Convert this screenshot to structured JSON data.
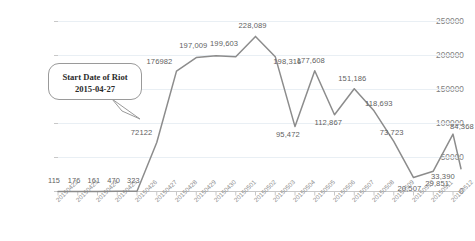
{
  "chart_data": {
    "type": "line",
    "title": "",
    "subtitle": "",
    "xlabel": "",
    "ylabel": "",
    "grid": true,
    "legend_position": "none",
    "ylim": [
      0,
      250000
    ],
    "yticks": [
      0,
      50000,
      100000,
      150000,
      200000,
      250000
    ],
    "ytick_labels": [
      "0",
      "50000",
      "100000",
      "150000",
      "200000",
      "250000"
    ],
    "categories": [
      "20150422",
      "20150423",
      "20150424",
      "20150425",
      "20150426",
      "20150427",
      "20150428",
      "20150429",
      "20150430",
      "20150501",
      "20150502",
      "20150503",
      "20150504",
      "20150505",
      "20150506",
      "20150507",
      "20150508",
      "20150509",
      "20150510",
      "20150511",
      "20150512"
    ],
    "values": [
      115,
      176,
      161,
      470,
      323,
      72122,
      176982,
      197009,
      199603,
      198316,
      228089,
      198316,
      95472,
      177608,
      112867,
      151186,
      118693,
      73723,
      20507,
      29851,
      84368
    ],
    "point_labels": [
      "115",
      "176",
      "161",
      "470",
      "323",
      "72122",
      "176982",
      "197,009",
      "199,603",
      "",
      "228,089",
      "198,316",
      "95,472",
      "177,608",
      "112,867",
      "151,186",
      "118,693",
      "73,723",
      "20,507",
      "29,851",
      "84,368"
    ],
    "extra_labels": [
      "33,390"
    ],
    "line_color": "#8c8c8c",
    "grid_color": "#e8eef3",
    "text_color": "#7f7f7f"
  },
  "annotation": {
    "line1": "Start Date of Riot",
    "line2": "2015-04-27"
  }
}
